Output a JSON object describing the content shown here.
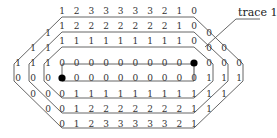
{
  "diagram": {
    "label": "trace 1",
    "colors": {
      "ink": "#333333",
      "dot": "#000000",
      "background": "#ffffff"
    },
    "main_rows": [
      [
        "1",
        "2",
        "3",
        "3",
        "3",
        "3",
        "3",
        "2",
        "1",
        "0"
      ],
      [
        "1",
        "2",
        "2",
        "2",
        "2",
        "2",
        "2",
        "2",
        "1",
        "0"
      ],
      [
        "1",
        "1",
        "1",
        "1",
        "1",
        "1",
        "1",
        "1",
        "1",
        "0"
      ],
      [
        "0",
        "0",
        "0",
        "0",
        "0",
        "0",
        "0",
        "0",
        "0",
        "●"
      ],
      [
        "●",
        "0",
        "0",
        "0",
        "0",
        "0",
        "0",
        "0",
        "0",
        "0"
      ],
      [
        "0",
        "1",
        "1",
        "1",
        "1",
        "1",
        "1",
        "1",
        "1",
        "1"
      ],
      [
        "0",
        "1",
        "2",
        "2",
        "2",
        "2",
        "2",
        "2",
        "2",
        "1"
      ],
      [
        "0",
        "1",
        "2",
        "3",
        "3",
        "3",
        "3",
        "3",
        "2",
        "1"
      ]
    ],
    "left_side": [
      [
        "1"
      ],
      [
        "1",
        "1"
      ],
      [
        "1",
        "1",
        "1"
      ],
      [
        "0",
        "0",
        "0"
      ],
      [
        "0",
        "0"
      ],
      [
        "0"
      ]
    ],
    "right_side": [
      [
        "0"
      ],
      [
        "0",
        "0"
      ],
      [
        "0",
        "0",
        "0"
      ],
      [
        "1",
        "1",
        "1"
      ],
      [
        "1",
        "1"
      ],
      [
        "1"
      ]
    ],
    "endpoints": [
      "source-dot",
      "target-dot"
    ]
  }
}
